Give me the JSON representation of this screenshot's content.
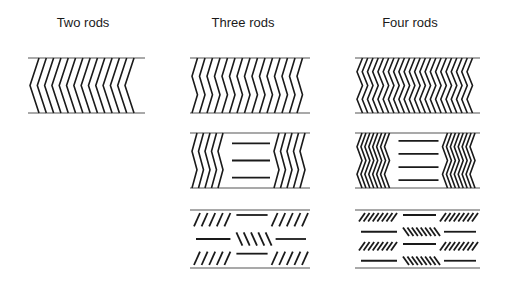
{
  "columns": [
    {
      "title": "Two rods",
      "title_x": 83,
      "x0": 28,
      "x1": 145,
      "rows": [
        {
          "type": "chevron",
          "y0": 58,
          "y1": 113,
          "count": 14,
          "bends": 1
        }
      ]
    },
    {
      "title": "Three rods",
      "title_x": 243,
      "x0": 190,
      "x1": 310,
      "rows": [
        {
          "type": "zigzag",
          "y0": 58,
          "y1": 113,
          "count": 15,
          "bends": 2
        },
        {
          "type": "zigzag-with-bars",
          "y0": 133,
          "y1": 188,
          "side_count": 5,
          "bends": 2,
          "bars": 3
        },
        {
          "type": "slanted-with-bars",
          "y0": 210,
          "y1": 268,
          "side_count": 5,
          "layers": 3
        }
      ]
    },
    {
      "title": "Four rods",
      "title_x": 410,
      "x0": 355,
      "x1": 480,
      "rows": [
        {
          "type": "zigzag",
          "y0": 58,
          "y1": 113,
          "count": 22,
          "bends": 3
        },
        {
          "type": "zigzag-with-bars",
          "y0": 133,
          "y1": 188,
          "side_count": 8,
          "bends": 3,
          "bars": 4
        },
        {
          "type": "slanted-with-bars",
          "y0": 210,
          "y1": 268,
          "side_count": 8,
          "layers": 4
        }
      ]
    }
  ],
  "colors": {
    "line": "#1a1a1a",
    "rule": "#555555"
  }
}
